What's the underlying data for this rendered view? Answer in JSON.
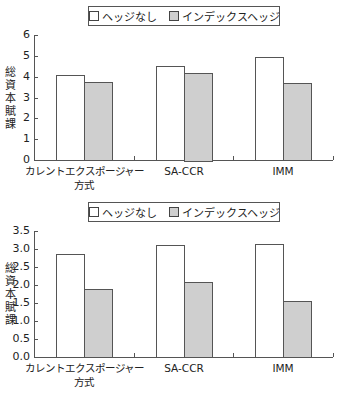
{
  "legend": {
    "items": [
      {
        "label": "ヘッジなし",
        "color": "#ffffff"
      },
      {
        "label": "インデックスヘッジ",
        "color": "#cfcfcf"
      }
    ]
  },
  "chart1": {
    "ylabel": "総資本賦課",
    "yticks": [
      "0",
      "1",
      "2",
      "3",
      "4",
      "5",
      "6"
    ],
    "categories": [
      "カレントエクスポージャー\n方式",
      "SA-CCR",
      "IMM"
    ],
    "cat_line1": [
      "カレントエクスポージャー",
      "SA-CCR",
      "IMM"
    ],
    "cat_line2": [
      "方式",
      "",
      ""
    ]
  },
  "chart2": {
    "ylabel": "総資本賦課",
    "yticks": [
      "0.0",
      "0.5",
      "1.0",
      "1.5",
      "2.0",
      "2.5",
      "3.0",
      "3.5"
    ],
    "cat_line1": [
      "カレントエクスポージャー",
      "SA-CCR",
      "IMM"
    ],
    "cat_line2": [
      "方式",
      "",
      ""
    ]
  },
  "chart_data": [
    {
      "type": "bar",
      "title": "",
      "xlabel": "",
      "ylabel": "総資本賦課",
      "categories": [
        "カレントエクスポージャー方式",
        "SA-CCR",
        "IMM"
      ],
      "series": [
        {
          "name": "ヘッジなし",
          "values": [
            4.1,
            4.5,
            4.95
          ]
        },
        {
          "name": "インデックスヘッジ",
          "values": [
            3.75,
            4.2,
            3.7
          ]
        }
      ],
      "ylim": [
        0,
        6
      ],
      "yticks": [
        0,
        1,
        2,
        3,
        4,
        5,
        6
      ],
      "grid": false,
      "legend_position": "top"
    },
    {
      "type": "bar",
      "title": "",
      "xlabel": "",
      "ylabel": "総資本賦課",
      "categories": [
        "カレントエクスポージャー方式",
        "SA-CCR",
        "IMM"
      ],
      "series": [
        {
          "name": "ヘッジなし",
          "values": [
            2.85,
            3.1,
            3.15
          ]
        },
        {
          "name": "インデックスヘッジ",
          "values": [
            1.88,
            2.08,
            1.55
          ]
        }
      ],
      "ylim": [
        0,
        3.5
      ],
      "yticks": [
        0.0,
        0.5,
        1.0,
        1.5,
        2.0,
        2.5,
        3.0,
        3.5
      ],
      "grid": false,
      "legend_position": "top"
    }
  ]
}
